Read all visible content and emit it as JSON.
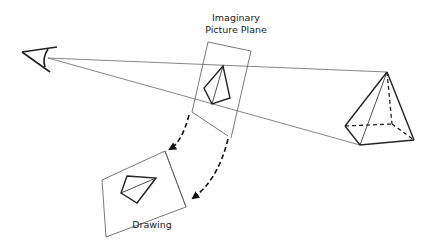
{
  "diagram": {
    "labels": {
      "picture_plane_line1": "Imaginary",
      "picture_plane_line2": "Picture Plane",
      "drawing": "Drawing"
    },
    "elements": [
      {
        "id": "eye",
        "description": "Viewer's eye (stylized)"
      },
      {
        "id": "sight-lines",
        "description": "Lines of sight from eye to pyramid"
      },
      {
        "id": "picture-plane",
        "description": "Imaginary picture plane with projected kite-shaped image"
      },
      {
        "id": "pyramid",
        "description": "Wireframe square pyramid with hidden edges dashed"
      },
      {
        "id": "rotation-arrows",
        "description": "Two dashed curved arrows rotating plane down to drawing"
      },
      {
        "id": "drawing",
        "description": "Drawing sheet showing resulting projection"
      }
    ],
    "colors": {
      "line": "#333333",
      "thin_line": "#555555",
      "background": "#ffffff"
    }
  }
}
